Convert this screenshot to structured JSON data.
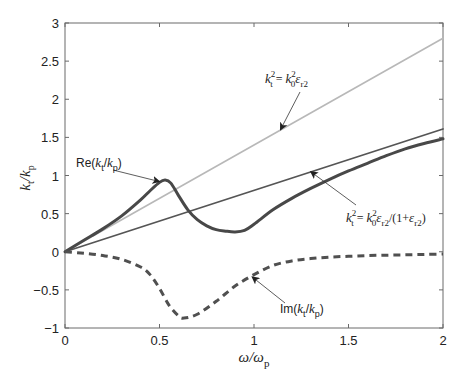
{
  "chart_data": {
    "type": "line",
    "title": "",
    "xlabel": "ω/ω_p",
    "ylabel": "k_t/k_p",
    "xlim": [
      0,
      2
    ],
    "ylim": [
      -1,
      3
    ],
    "xticks": [
      "0",
      "0.5",
      "1",
      "1.5",
      "2"
    ],
    "yticks": [
      "-1",
      "-0.5",
      "0",
      "0.5",
      "1",
      "1.5",
      "2",
      "2.5",
      "3"
    ],
    "xtick_values": [
      0,
      0.5,
      1,
      1.5,
      2
    ],
    "ytick_values": [
      -1,
      -0.5,
      0,
      0.5,
      1,
      1.5,
      2,
      2.5,
      3
    ],
    "grid": false,
    "legend": null,
    "series": [
      {
        "name": "k_t^2 = k_0^2 ε_r2",
        "style": "solid-light",
        "color": "#b8b8b8",
        "x": [
          0,
          2
        ],
        "y": [
          0,
          2.8
        ]
      },
      {
        "name": "k_t^2 = k_0^2 ε_r2/(1+ε_r2)",
        "style": "solid-medium",
        "color": "#555555",
        "x": [
          0,
          2
        ],
        "y": [
          0,
          1.61
        ]
      },
      {
        "name": "Re(k_t/k_p)",
        "style": "solid-thick",
        "color": "#484848",
        "x": [
          0,
          0.1,
          0.2,
          0.3,
          0.4,
          0.45,
          0.5,
          0.53,
          0.56,
          0.6,
          0.65,
          0.7,
          0.75,
          0.8,
          0.85,
          0.9,
          0.95,
          1.0,
          1.1,
          1.2,
          1.3,
          1.4,
          1.5,
          1.6,
          1.7,
          1.8,
          1.9,
          2.0
        ],
        "y": [
          0,
          0.15,
          0.3,
          0.47,
          0.68,
          0.8,
          0.91,
          0.94,
          0.9,
          0.74,
          0.55,
          0.42,
          0.34,
          0.29,
          0.27,
          0.26,
          0.28,
          0.36,
          0.55,
          0.7,
          0.83,
          0.95,
          1.06,
          1.16,
          1.26,
          1.35,
          1.42,
          1.48
        ]
      },
      {
        "name": "Im(k_t/k_p)",
        "style": "dashed-thick",
        "color": "#505050",
        "x": [
          0,
          0.1,
          0.2,
          0.3,
          0.4,
          0.45,
          0.5,
          0.55,
          0.6,
          0.63,
          0.7,
          0.8,
          0.9,
          1.0,
          1.1,
          1.2,
          1.3,
          1.4,
          1.5,
          1.6,
          1.7,
          1.8,
          1.9,
          2.0
        ],
        "y": [
          0,
          -0.02,
          -0.05,
          -0.1,
          -0.2,
          -0.3,
          -0.48,
          -0.7,
          -0.84,
          -0.87,
          -0.82,
          -0.65,
          -0.45,
          -0.3,
          -0.18,
          -0.12,
          -0.09,
          -0.07,
          -0.06,
          -0.05,
          -0.045,
          -0.04,
          -0.035,
          -0.03
        ]
      }
    ],
    "annotations": [
      {
        "id": "ann-light",
        "text_main": "k",
        "parts": [
          "k",
          "t",
          "2",
          "=",
          "k",
          "0",
          "2",
          "ε",
          "r2"
        ],
        "label": "k_t^2 = k_0^2 ε_r2",
        "text_xy": [
          1.05,
          2.2
        ],
        "arrow_to": [
          1.14,
          1.6
        ]
      },
      {
        "id": "ann-re",
        "label": "Re(k_t/k_p)",
        "text_xy": [
          0.09,
          1.15
        ],
        "arrow_to": [
          0.5,
          0.92
        ]
      },
      {
        "id": "ann-mid",
        "label": "k_t^2 = k_0^2 ε_r2/(1+ε_r2)",
        "text_xy": [
          1.52,
          0.5
        ],
        "arrow_to": [
          1.3,
          1.05
        ]
      },
      {
        "id": "ann-im",
        "label": "Im(k_t/k_p)",
        "text_xy": [
          1.12,
          -0.6
        ],
        "arrow_to": [
          0.99,
          -0.33
        ]
      }
    ]
  },
  "labels": {
    "xlabel_main": "ω/ω",
    "xlabel_sub": "p",
    "ylabel_k1": "k",
    "ylabel_sub1": "t",
    "ylabel_slash": "/",
    "ylabel_k2": "k",
    "ylabel_sub2": "p",
    "re_label_prefix": "Re(",
    "re_k1": "k",
    "re_sub1": "t",
    "re_slash": "/",
    "re_k2": "k",
    "re_sub2": "p",
    "re_close": ")",
    "im_label_prefix": "Im(",
    "im_k1": "k",
    "im_sub1": "t",
    "im_slash": "/",
    "im_k2": "k",
    "im_sub2": "p",
    "im_close": ")",
    "eq1_k": "k",
    "eq1_sub_t": "t",
    "eq1_sup_2": "2",
    "eq1_eq": " = ",
    "eq1_k0": "k",
    "eq1_sub_0": "0",
    "eq1_sup_2b": "2",
    "eq1_eps": "ε",
    "eq1_sub_r2": "r2",
    "eq2_k": "k",
    "eq2_sub_t": "t",
    "eq2_sup_2": "2",
    "eq2_eq": " = ",
    "eq2_k0": "k",
    "eq2_sub_0": "0",
    "eq2_sup_2b": "2",
    "eq2_eps": "ε",
    "eq2_sub_r2": "r2",
    "eq2_mid": "/(1+",
    "eq2_eps2": "ε",
    "eq2_sub_r2b": "r2",
    "eq2_close": ")"
  },
  "colors": {
    "axis": "#555555",
    "light_line": "#b8b8b8",
    "mid_line": "#555555",
    "re_line": "#484848",
    "im_line": "#505050",
    "arrow": "#333333"
  }
}
